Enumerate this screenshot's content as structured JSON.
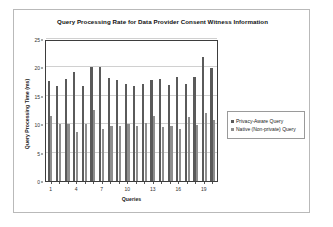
{
  "chart_data": {
    "type": "bar",
    "title": "Query Processing Rate for Data Provider Consent Witness Information",
    "xlabel": "Queries",
    "ylabel": "Query Processing Time (ms)",
    "ylim": [
      0,
      25
    ],
    "yticks": [
      0,
      5,
      10,
      15,
      20,
      25
    ],
    "xticks_shown": [
      1,
      4,
      7,
      10,
      13,
      16,
      19
    ],
    "categories": [
      1,
      2,
      3,
      4,
      5,
      6,
      7,
      8,
      9,
      10,
      11,
      12,
      13,
      14,
      15,
      16,
      17,
      18,
      19,
      20
    ],
    "grid": "horizontal",
    "legend_position": "right-outside",
    "series": [
      {
        "name": "Privacy-Aware Query",
        "color": "#5a5a5a",
        "values": [
          17.6,
          16.8,
          17.9,
          19.2,
          16.7,
          20.0,
          20.0,
          18.2,
          17.8,
          17.0,
          16.8,
          17.1,
          17.7,
          18.0,
          16.9,
          18.4,
          17.0,
          18.3,
          21.8,
          19.9
        ]
      },
      {
        "name": "Native (Non-private) Query",
        "color": "#8e8e8e",
        "values": [
          11.4,
          10.0,
          10.1,
          8.7,
          10.0,
          12.5,
          9.2,
          9.7,
          9.6,
          10.1,
          9.6,
          10.2,
          11.4,
          9.5,
          9.7,
          9.2,
          11.3,
          9.9,
          11.9,
          10.8
        ]
      }
    ]
  },
  "legend": {
    "items": [
      {
        "label": "Privacy-Aware Query"
      },
      {
        "label": "Native (Non-private) Query"
      }
    ]
  }
}
